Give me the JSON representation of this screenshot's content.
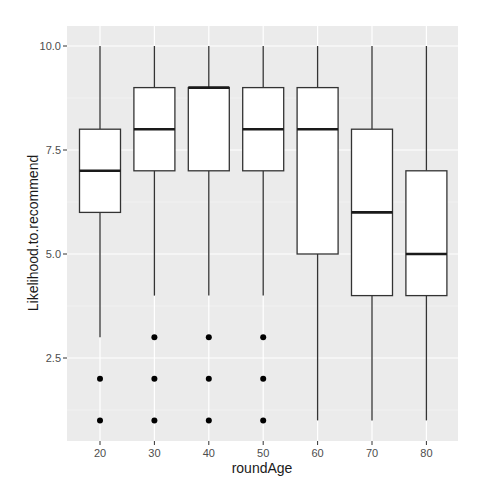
{
  "chart_data": {
    "type": "boxplot",
    "title": "",
    "xlabel": "roundAge",
    "ylabel": "Likelihood.to.recommend",
    "categories": [
      "20",
      "30",
      "40",
      "50",
      "60",
      "70",
      "80"
    ],
    "y_ticks": [
      2.5,
      5.0,
      7.5,
      10.0
    ],
    "y_tick_labels": [
      "2.5",
      "5.0",
      "7.5",
      "10.0"
    ],
    "ylim": [
      0.6,
      10.5
    ],
    "grid": true,
    "legend": null,
    "series": [
      {
        "category": "20",
        "whisker_low": 3,
        "q1": 6,
        "median": 7,
        "q3": 8,
        "whisker_high": 10,
        "outliers": [
          1,
          2
        ]
      },
      {
        "category": "30",
        "whisker_low": 4,
        "q1": 7,
        "median": 8,
        "q3": 9,
        "whisker_high": 10,
        "outliers": [
          1,
          2,
          3
        ]
      },
      {
        "category": "40",
        "whisker_low": 4,
        "q1": 7,
        "median": 9,
        "q3": 9,
        "whisker_high": 10,
        "outliers": [
          1,
          2,
          3
        ]
      },
      {
        "category": "50",
        "whisker_low": 4,
        "q1": 7,
        "median": 8,
        "q3": 9,
        "whisker_high": 10,
        "outliers": [
          1,
          2,
          3
        ]
      },
      {
        "category": "60",
        "whisker_low": 1,
        "q1": 5,
        "median": 8,
        "q3": 9,
        "whisker_high": 10,
        "outliers": []
      },
      {
        "category": "70",
        "whisker_low": 1,
        "q1": 4,
        "median": 6,
        "q3": 8,
        "whisker_high": 10,
        "outliers": []
      },
      {
        "category": "80",
        "whisker_low": 1,
        "q1": 4,
        "median": 5,
        "q3": 7,
        "whisker_high": 10,
        "outliers": []
      }
    ]
  },
  "colors": {
    "panel_background": "#ebebeb",
    "grid_major": "#ffffff",
    "grid_minor": "#f5f5f5",
    "box_fill": "#ffffff",
    "box_stroke": "#333333",
    "outlier": "#000000",
    "tick_text": "#4d4d4d",
    "axis_title": "#1a1a1a"
  }
}
